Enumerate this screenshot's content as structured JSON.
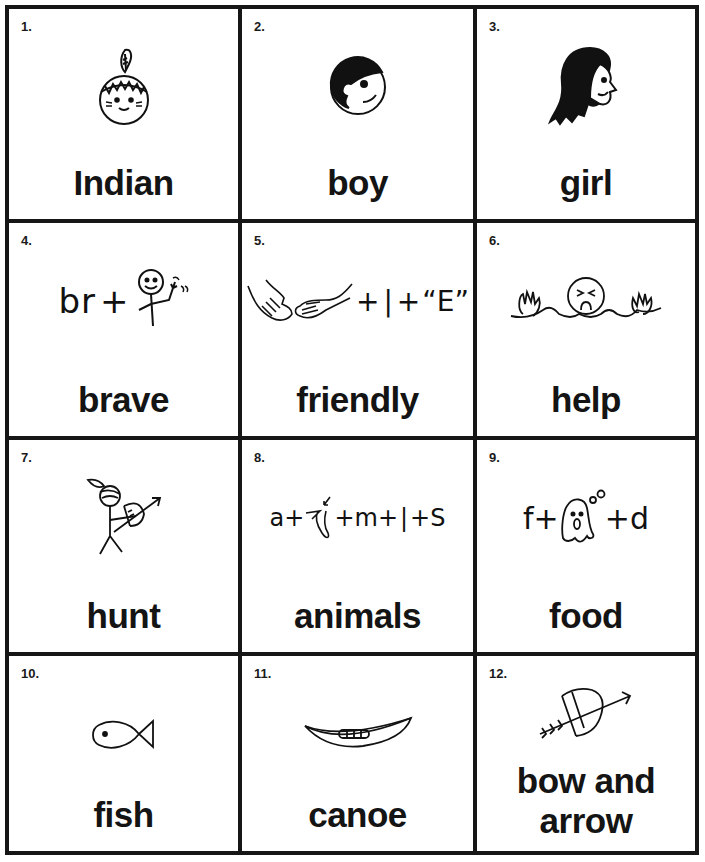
{
  "cards": [
    {
      "number": "1.",
      "word": "Indian",
      "picture": "indian-face-with-feather"
    },
    {
      "number": "2.",
      "word": "boy",
      "picture": "boy-face"
    },
    {
      "number": "3.",
      "word": "girl",
      "picture": "girl-face"
    },
    {
      "number": "4.",
      "word": "brave",
      "picture": "rebus-br-plus-waving-stickman",
      "rebus": [
        "br",
        "+"
      ]
    },
    {
      "number": "5.",
      "word": "friendly",
      "picture": "rebus-handshake-plus-l-plus-E",
      "rebus": [
        "+",
        "|",
        "+",
        "“E”"
      ]
    },
    {
      "number": "6.",
      "word": "help",
      "picture": "drowning-person"
    },
    {
      "number": "7.",
      "word": "hunt",
      "picture": "stickman-with-bow"
    },
    {
      "number": "8.",
      "word": "animals",
      "picture": "rebus-a-plus-knee-plus-m-plus-l-plus-s",
      "rebus": [
        "a+",
        "+m+",
        "|",
        "+S"
      ]
    },
    {
      "number": "9.",
      "word": "food",
      "picture": "rebus-f-plus-ghost-plus-d",
      "rebus": [
        "f+",
        "+d"
      ]
    },
    {
      "number": "10.",
      "word": "fish",
      "picture": "fish"
    },
    {
      "number": "11.",
      "word": "canoe",
      "picture": "canoe"
    },
    {
      "number": "12.",
      "word_line1": "bow and",
      "word_line2": "arrow",
      "picture": "bow-and-arrow"
    }
  ]
}
